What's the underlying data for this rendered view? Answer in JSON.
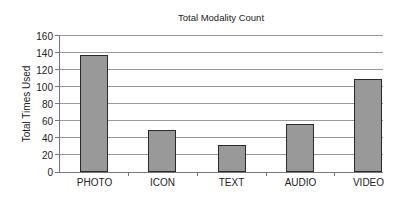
{
  "chart_data": {
    "type": "bar",
    "title": "Total Modality Count",
    "xlabel": "",
    "ylabel": "Total Times Used",
    "categories": [
      "PHOTO",
      "ICON",
      "TEXT",
      "AUDIO",
      "VIDEO"
    ],
    "values": [
      137,
      49,
      31,
      56,
      109
    ],
    "ylim": [
      0,
      160
    ],
    "yticks": [
      0,
      20,
      40,
      60,
      80,
      100,
      120,
      140,
      160
    ],
    "grid": true,
    "legend": null,
    "bar_color": "#8c8c8c"
  },
  "labels": {
    "title": "Total Modality Count",
    "ylabel": "Total Times Used",
    "yticks": [
      "0",
      "20",
      "40",
      "60",
      "80",
      "100",
      "120",
      "140",
      "160"
    ],
    "categories": [
      "PHOTO",
      "ICON",
      "TEXT",
      "AUDIO",
      "VIDEO"
    ]
  }
}
